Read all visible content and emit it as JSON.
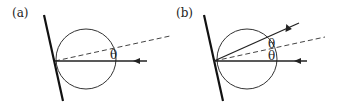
{
  "panels": [
    {
      "label": "(a)",
      "angle_labels": [
        "θ"
      ],
      "rays": [
        "incident",
        "normal-dashed"
      ]
    },
    {
      "label": "(b)",
      "angle_labels": [
        "θ",
        "θ"
      ],
      "rays": [
        "incident",
        "normal-dashed",
        "reflected"
      ]
    }
  ]
}
